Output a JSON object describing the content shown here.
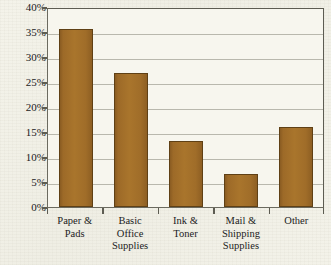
{
  "chart_data": {
    "type": "bar",
    "title": "",
    "xlabel": "",
    "ylabel": "",
    "categories": [
      "Paper & Pads",
      "Basic Office Supplies",
      "Ink & Toner",
      "Mail & Shipping Supplies",
      "Other"
    ],
    "category_lines": [
      [
        "Paper &",
        "Pads"
      ],
      [
        "Basic",
        "Office",
        "Supplies"
      ],
      [
        "Ink &",
        "Toner"
      ],
      [
        "Mail &",
        "Shipping",
        "Supplies"
      ],
      [
        "Other"
      ]
    ],
    "values": [
      35.7,
      26.8,
      13.2,
      6.7,
      16.1
    ],
    "ylim": [
      0,
      40
    ],
    "ytick_labels": [
      "40%",
      "35%",
      "30%",
      "25%",
      "20%",
      "15%",
      "10%",
      "5%",
      "0%"
    ],
    "ytick_values": [
      40,
      35,
      30,
      25,
      20,
      15,
      10,
      5,
      0
    ],
    "grid": true,
    "legend": false,
    "bar_color": "#a9752c",
    "bar_edge_color": "#5f4015",
    "grid_color": "#b9b8ad",
    "axis_color": "#5d5c52",
    "plot_background": "#f7f6ee",
    "page_background": "#f2f1e8"
  }
}
